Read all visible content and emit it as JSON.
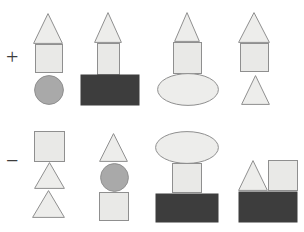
{
  "canvas": {
    "width": 304,
    "height": 232,
    "background": "#ffffff"
  },
  "palette": {
    "light_fill": "#e9e9e7",
    "light_fill_alt": "#ededeb",
    "dark_fill": "#3d3d3d",
    "medium_gray_fill": "#a9a9a9",
    "outline": "#8f8f8f",
    "label_color": "#3c3c3c"
  },
  "rows": [
    {
      "id": "positive-row",
      "label": "+",
      "label_name": "plus-sign",
      "y_top": 10,
      "figures": [
        {
          "id": "figure-plus-1",
          "name": "figure-triangle-square-circle",
          "shapes": [
            {
              "type": "triangle",
              "name": "triangle-top",
              "x": 33,
              "y": 13,
              "w": 30,
              "h": 31,
              "fill": "#ededeb"
            },
            {
              "type": "square",
              "name": "square-middle",
              "x": 35,
              "y": 44,
              "w": 28,
              "h": 29,
              "fill": "#e9e9e7"
            },
            {
              "type": "circle",
              "name": "circle-bottom",
              "x": 34,
              "y": 75,
              "w": 30,
              "h": 30,
              "fill": "#a9a9a9"
            }
          ]
        },
        {
          "id": "figure-plus-2",
          "name": "figure-triangle-square-darkrect",
          "shapes": [
            {
              "type": "triangle",
              "name": "triangle-top",
              "x": 94,
              "y": 12,
              "w": 28,
              "h": 31,
              "fill": "#ededeb"
            },
            {
              "type": "square",
              "name": "square-middle",
              "x": 97,
              "y": 43,
              "w": 23,
              "h": 32,
              "fill": "#e9e9e7"
            },
            {
              "type": "rectangle",
              "name": "dark-rectangle-bottom",
              "x": 80,
              "y": 74,
              "w": 60,
              "h": 32,
              "fill": "#3d3d3d"
            }
          ]
        },
        {
          "id": "figure-plus-3",
          "name": "figure-triangle-square-ellipse",
          "shapes": [
            {
              "type": "triangle",
              "name": "triangle-top",
              "x": 174,
              "y": 12,
              "w": 26,
              "h": 30,
              "fill": "#ededeb"
            },
            {
              "type": "square",
              "name": "square-middle",
              "x": 173,
              "y": 42,
              "w": 29,
              "h": 32,
              "fill": "#e9e9e7"
            },
            {
              "type": "ellipse",
              "name": "ellipse-bottom",
              "x": 157,
              "y": 73,
              "w": 62,
              "h": 33,
              "fill": "#ededeb"
            }
          ]
        },
        {
          "id": "figure-plus-4",
          "name": "figure-triangle-square-triangle",
          "shapes": [
            {
              "type": "triangle",
              "name": "triangle-top",
              "x": 238,
              "y": 12,
              "w": 32,
              "h": 31,
              "fill": "#ededeb"
            },
            {
              "type": "square",
              "name": "square-middle",
              "x": 240,
              "y": 43,
              "w": 29,
              "h": 29,
              "fill": "#e9e9e7"
            },
            {
              "type": "triangle",
              "name": "triangle-bottom",
              "x": 241,
              "y": 75,
              "w": 29,
              "h": 30,
              "fill": "#ededeb"
            }
          ]
        }
      ]
    },
    {
      "id": "negative-row",
      "label": "−",
      "label_name": "minus-sign",
      "y_top": 128,
      "figures": [
        {
          "id": "figure-minus-1",
          "name": "figure-square-triangle-triangle",
          "shapes": [
            {
              "type": "square",
              "name": "square-top",
              "x": 34,
              "y": 131,
              "w": 31,
              "h": 31,
              "fill": "#e9e9e7"
            },
            {
              "type": "triangle",
              "name": "triangle-middle",
              "x": 34,
              "y": 162,
              "w": 31,
              "h": 27,
              "fill": "#ededeb"
            },
            {
              "type": "triangle",
              "name": "triangle-bottom",
              "x": 32,
              "y": 190,
              "w": 33,
              "h": 28,
              "fill": "#ededeb"
            }
          ]
        },
        {
          "id": "figure-minus-2",
          "name": "figure-triangle-circle-square",
          "shapes": [
            {
              "type": "triangle",
              "name": "triangle-top",
              "x": 99,
              "y": 133,
              "w": 29,
              "h": 29,
              "fill": "#ededeb"
            },
            {
              "type": "circle",
              "name": "circle-middle",
              "x": 100,
              "y": 163,
              "w": 29,
              "h": 29,
              "fill": "#a9a9a9"
            },
            {
              "type": "square",
              "name": "square-bottom",
              "x": 99,
              "y": 192,
              "w": 30,
              "h": 29,
              "fill": "#e9e9e7"
            }
          ]
        },
        {
          "id": "figure-minus-3",
          "name": "figure-ellipse-rect-darkrect",
          "shapes": [
            {
              "type": "ellipse",
              "name": "ellipse-top",
              "x": 155,
              "y": 131,
              "w": 64,
              "h": 33,
              "fill": "#ededeb"
            },
            {
              "type": "rectangle",
              "name": "rectangle-middle",
              "x": 172,
              "y": 163,
              "w": 30,
              "h": 30,
              "fill": "#e9e9e7"
            },
            {
              "type": "rectangle",
              "name": "dark-rectangle-bottom",
              "x": 155,
              "y": 193,
              "w": 64,
              "h": 30,
              "fill": "#3d3d3d"
            }
          ]
        },
        {
          "id": "figure-minus-4",
          "name": "figure-triangle-square-darkrect",
          "shapes": [
            {
              "type": "triangle",
              "name": "triangle-top-left",
              "x": 238,
              "y": 160,
              "w": 30,
              "h": 31,
              "fill": "#ededeb"
            },
            {
              "type": "square",
              "name": "square-top-right",
              "x": 268,
              "y": 160,
              "w": 30,
              "h": 31,
              "fill": "#e9e9e7"
            },
            {
              "type": "rectangle",
              "name": "dark-rectangle-bottom",
              "x": 238,
              "y": 191,
              "w": 60,
              "h": 32,
              "fill": "#3d3d3d"
            }
          ]
        }
      ]
    }
  ]
}
